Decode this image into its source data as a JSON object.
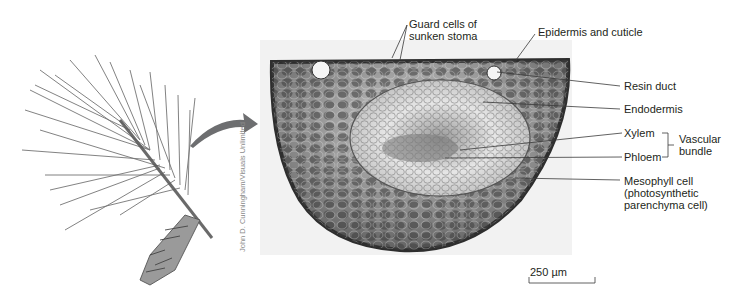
{
  "figure": {
    "labels": {
      "guard_cells": [
        "Guard cells of",
        "sunken stoma"
      ],
      "epidermis": "Epidermis and cuticle",
      "resin_duct": "Resin duct",
      "endodermis": "Endodermis",
      "xylem": "Xylem",
      "phloem": "Phloem",
      "vascular_bundle": [
        "Vascular",
        "bundle"
      ],
      "mesophyll": [
        "Mesophyll cell",
        "(photosynthetic",
        "parenchyma cell)"
      ]
    },
    "scale_bar": "250 µm",
    "credit": "John D. Cunningham/Visuals Unlimited",
    "colors": {
      "text": "#231f20",
      "leader": "#3a3a3a",
      "arrow": "#6d6e70",
      "tissue_dark": "#3c3c3c",
      "tissue_mid": "#7a7a7a",
      "tissue_light": "#d8d8d8"
    }
  }
}
